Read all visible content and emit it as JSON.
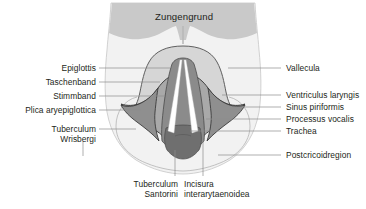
{
  "figure": {
    "title": "Zungengrund",
    "palette": {
      "background": "#ffffff",
      "outer_shield": "#f2f2f2",
      "tongue_base": "#c9c9c9",
      "epiglottis": "#d6d6d6",
      "vestibular_fold": "#b0b0b0",
      "ary_region": "#9a9a9a",
      "trachea": "#8b8b8b",
      "subglottic_dark": "#6f6f6f",
      "vocal_cord": "#ffffff",
      "outline": "#6e6e6e",
      "dark_outline": "#3a3a3a",
      "leader_line": "#8c8c8c",
      "text": "#231f20"
    },
    "labels_left": [
      {
        "id": "epiglottis",
        "text": "Epiglottis",
        "x": 96,
        "y": 65,
        "leader_to_x": 170,
        "leader_y": 68
      },
      {
        "id": "taschenband",
        "text": "Taschenband",
        "x": 96,
        "y": 79,
        "leader_to_x": 160,
        "leader_y": 82
      },
      {
        "id": "stimmband",
        "text": "Stimmband",
        "x": 96,
        "y": 93,
        "leader_to_x": 163,
        "leader_y": 96
      },
      {
        "id": "plica-aryepiglottica",
        "text": "Plica aryepiglottica",
        "x": 96,
        "y": 107,
        "leader_to_x": 140,
        "leader_y": 110
      },
      {
        "id": "tuberculum-wrisbergi",
        "text": "Tuberculum",
        "text2": "Wrisbergi",
        "x": 96,
        "y": 126,
        "leader_to_x": 134,
        "leader_y": 129
      }
    ],
    "labels_right": [
      {
        "id": "vallecula",
        "text": "Vallecula",
        "x": 285,
        "y": 65,
        "leader_from_x": 228,
        "leader_y": 68
      },
      {
        "id": "ventriculus-laryngis",
        "text": "Ventriculus laryngis",
        "x": 285,
        "y": 92,
        "leader_from_x": 222,
        "leader_y": 95
      },
      {
        "id": "sinus-piriformis",
        "text": "Sinus piriformis",
        "x": 285,
        "y": 104,
        "leader_from_x": 233,
        "leader_y": 107
      },
      {
        "id": "processus-vocalis",
        "text": "Processus vocalis",
        "x": 285,
        "y": 116,
        "leader_from_x": 206,
        "leader_y": 119
      },
      {
        "id": "trachea",
        "text": "Trachea",
        "x": 285,
        "y": 128,
        "leader_from_x": 190,
        "leader_y": 131
      },
      {
        "id": "postcricoidregion",
        "text": "Postcricoidregion",
        "x": 285,
        "y": 152,
        "leader_from_x": 218,
        "leader_y": 155
      }
    ],
    "labels_bottom": [
      {
        "id": "tuberculum-santorini",
        "text": "Tuberculum",
        "text2": "Santorini",
        "x": 148,
        "y": 182,
        "leader_x": 175,
        "leader_from_y": 150,
        "leader_to_y": 176
      },
      {
        "id": "incisura-interarytaenoidea",
        "text": "Incisura",
        "text2": "interarytaenoidea",
        "x": 201,
        "y": 182,
        "leader_x": 203,
        "leader_from_y": 145,
        "leader_to_y": 176
      }
    ]
  }
}
